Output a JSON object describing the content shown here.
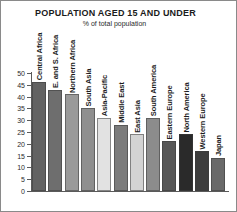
{
  "chart": {
    "title": "POPULATION AGED 15 AND UNDER",
    "subtitle": "% of total population"
  },
  "chart_data": {
    "type": "bar",
    "title": "POPULATION AGED 15 AND UNDER",
    "subtitle": "% of total population",
    "xlabel": "",
    "ylabel": "% of total population",
    "ylim": [
      0,
      50
    ],
    "yticks": [
      50,
      45,
      40,
      35,
      30,
      25,
      20,
      15,
      10,
      5,
      0
    ],
    "grid": false,
    "legend": "none",
    "categories": [
      "Central Africa",
      "E. and S. Africa",
      "Northern Africa",
      "South Asia",
      "Asia-Pacific",
      "Middle East",
      "East Asia",
      "South America",
      "Eastern Europe",
      "North America",
      "Western Europe",
      "Japan"
    ],
    "values": [
      46,
      43,
      41,
      35,
      31,
      28,
      24,
      31,
      21,
      24,
      17,
      14
    ],
    "colors": [
      "#636363",
      "#6e6e6e",
      "#9a9a9a",
      "#8f8f8f",
      "#e2e2e2",
      "#7b7b7b",
      "#d3d3d3",
      "#8c8c8c",
      "#575757",
      "#2a2a2a",
      "#3d3d3d",
      "#6a6a6a"
    ]
  }
}
